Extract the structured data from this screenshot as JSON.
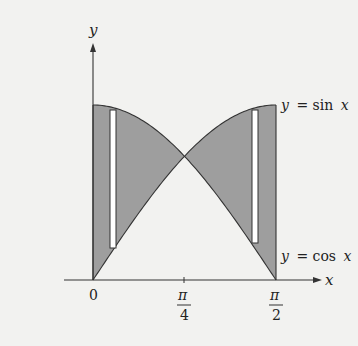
{
  "figure": {
    "axes": {
      "x_label": "x",
      "y_label": "y",
      "x_ticks": [
        {
          "label": "0",
          "value": 0
        },
        {
          "label_num": "π",
          "label_den": "4",
          "value": 0.7854
        },
        {
          "label_num": "π",
          "label_den": "2",
          "value": 1.5708
        }
      ]
    },
    "curves": [
      {
        "name": "sine",
        "label": "y = sin x",
        "label_y": "y",
        "label_eq": "= sin",
        "label_x": "x"
      },
      {
        "name": "cosine",
        "label": "y = cos x",
        "label_y": "y",
        "label_eq": "= cos",
        "label_x": "x"
      }
    ],
    "colors": {
      "background": "#f2f2f0",
      "shade": "#9e9e9e",
      "stroke": "#333333",
      "rectangle_fill": "#ffffff"
    },
    "intersection": {
      "x": 0.7854,
      "y": 0.7071
    }
  }
}
